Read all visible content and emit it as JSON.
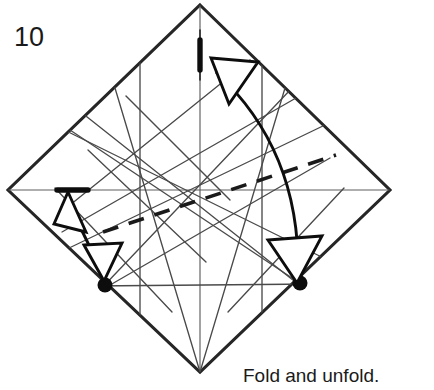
{
  "figure": {
    "step_number": "10",
    "caption": "Fold and unfold.",
    "kind": "origami-crease-pattern-diagram",
    "paper_shape": "square-rotated-45-diamond",
    "colors": {
      "paper_edge": "#262626",
      "crease_line": "#5e5e5e",
      "valley_fold": "#1a1a1a",
      "reference_dot": "#0d0d0d",
      "arrow": "#0d0d0d",
      "background": "#ffffff",
      "text": "#1a1a1a"
    },
    "canvas": {
      "width": 434,
      "height": 390
    },
    "paper_vertices": [
      {
        "name": "top",
        "x": 200,
        "y": 5
      },
      {
        "name": "right",
        "x": 390,
        "y": 190
      },
      {
        "name": "bottom",
        "x": 200,
        "y": 372
      },
      {
        "name": "left",
        "x": 8,
        "y": 190
      }
    ],
    "center": {
      "x": 200,
      "y": 190
    },
    "existing_creases": [
      {
        "name": "horizontal-diagonal",
        "x1": 8,
        "y1": 190,
        "x2": 390,
        "y2": 190
      },
      {
        "name": "vertical-diagonal",
        "x1": 200,
        "y1": 5,
        "x2": 200,
        "y2": 372
      },
      {
        "name": "crease-a",
        "x1": 60,
        "y1": 128,
        "x2": 300,
        "y2": 283
      },
      {
        "name": "crease-b",
        "x1": 105,
        "y1": 285,
        "x2": 285,
        "y2": 95
      },
      {
        "name": "crease-c",
        "x1": 78,
        "y1": 225,
        "x2": 290,
        "y2": 103
      },
      {
        "name": "crease-d",
        "x1": 80,
        "y1": 112,
        "x2": 300,
        "y2": 283
      },
      {
        "name": "crease-e",
        "x1": 105,
        "y1": 285,
        "x2": 320,
        "y2": 163
      },
      {
        "name": "crease-f",
        "x1": 118,
        "y1": 85,
        "x2": 200,
        "y2": 372
      },
      {
        "name": "crease-g",
        "x1": 282,
        "y1": 85,
        "x2": 200,
        "y2": 372
      },
      {
        "name": "crease-h",
        "x1": 105,
        "y1": 285,
        "x2": 305,
        "y2": 288
      },
      {
        "name": "crease-i",
        "x1": 62,
        "y1": 190,
        "x2": 165,
        "y2": 300
      },
      {
        "name": "crease-j",
        "x1": 338,
        "y1": 190,
        "x2": 236,
        "y2": 300
      },
      {
        "name": "crease-k",
        "x1": 140,
        "y1": 60,
        "x2": 140,
        "y2": 318
      },
      {
        "name": "crease-l",
        "x1": 262,
        "y1": 60,
        "x2": 262,
        "y2": 318
      },
      {
        "name": "crease-m",
        "x1": 70,
        "y1": 120,
        "x2": 330,
        "y2": 260
      },
      {
        "name": "crease-n",
        "x1": 70,
        "y1": 260,
        "x2": 330,
        "y2": 120
      }
    ],
    "new_fold_line": {
      "type": "valley-fold-dashed",
      "x1": 103,
      "y1": 232,
      "x2": 336,
      "y2": 155
    },
    "reference_marks": [
      {
        "name": "top-tick",
        "type": "thick-tick",
        "orientation": "vertical",
        "x": 200,
        "y1": 38,
        "y2": 72
      },
      {
        "name": "left-tick",
        "type": "thick-tick",
        "orientation": "horizontal",
        "y": 190,
        "x1": 57,
        "x2": 88
      }
    ],
    "reference_dots": [
      {
        "name": "left-dot",
        "x": 105,
        "y": 285,
        "r": 7.5
      },
      {
        "name": "right-dot",
        "x": 300,
        "y": 283,
        "r": 7.5
      }
    ],
    "arrows": [
      {
        "name": "right-curved-fold-arrow",
        "style": "double-headed-curved",
        "from": {
          "x": 300,
          "y": 283
        },
        "to": {
          "x": 212,
          "y": 62
        },
        "control": {
          "x": 300,
          "y": 140
        }
      },
      {
        "name": "left-straight-fold-arrow",
        "style": "double-headed-straight",
        "from": {
          "x": 105,
          "y": 285
        },
        "to": {
          "x": 70,
          "y": 196
        }
      }
    ]
  }
}
